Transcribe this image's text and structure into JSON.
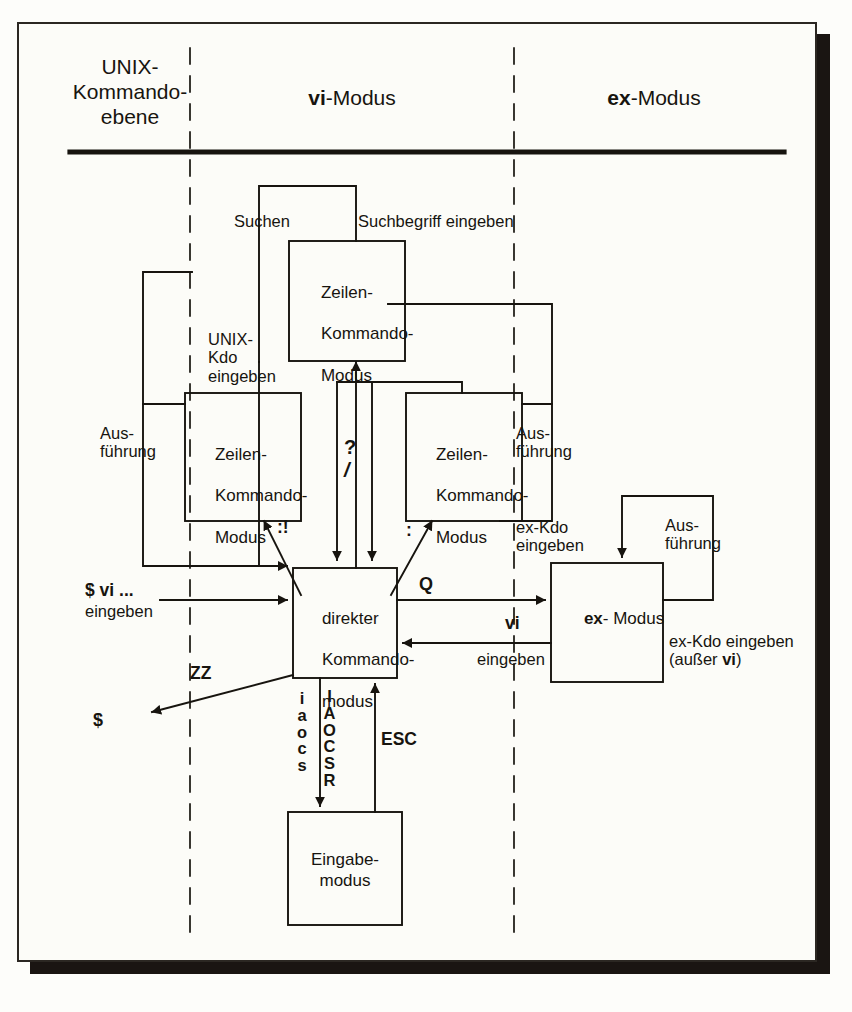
{
  "diagram": {
    "title_columns": [
      {
        "bold": "UNIX-",
        "rest": "Kommando-\nebene",
        "all_regular": true
      },
      {
        "bold": "vi",
        "rest": "-Modus"
      },
      {
        "bold": "ex",
        "rest": "-Modus"
      }
    ],
    "headers": {
      "unix_line1": "UNIX-",
      "unix_line2": "Kommando-",
      "unix_line3": "ebene",
      "vi_bold": "vi",
      "vi_rest": "-Modus",
      "ex_bold": "ex",
      "ex_rest": "-Modus"
    },
    "boxes": {
      "search_line_mode": {
        "line1": "Zeilen-",
        "line2": "Kommando-",
        "line3": "Modus"
      },
      "unix_line_mode": {
        "line1": "Zeilen-",
        "line2": "Kommando-",
        "line3": "Modus"
      },
      "ex_line_mode": {
        "line1": "Zeilen-",
        "line2": "Kommando-",
        "line3": "Modus"
      },
      "direct_command_mode": {
        "line1": "direkter",
        "line2": "Kommando-",
        "line3": "modus"
      },
      "ex_mode": {
        "bold": "ex",
        "rest": "- Modus"
      },
      "input_mode": {
        "line1": "Eingabe-",
        "line2": "modus"
      }
    },
    "labels": {
      "suchen": "Suchen",
      "suchbegriff_eingeben": "Suchbegriff eingeben",
      "unix_kdo_eingeben": "UNIX-\nKdo\neingeben",
      "ausfuehrung_left": "Aus-\nführung",
      "ausfuehrung_mid": "Aus-\nführung",
      "ausfuehrung_right": "Aus-\nführung",
      "ex_kdo_eingeben_mid": "ex-Kdo\neingeben",
      "ex_kdo_eingeben_right_l1": "ex-Kdo eingeben",
      "ex_kdo_eingeben_right_l2_pre": "(außer ",
      "ex_kdo_eingeben_right_l2_bold": "vi",
      "ex_kdo_eingeben_right_l2_post": ")",
      "question_mark": "?",
      "slash": "/",
      "colon_bang": ":!",
      "colon": ":",
      "q": "Q",
      "vi_key": "vi",
      "eingeben": "eingeben",
      "dollar_vi_bold": "$ vi ...",
      "dollar_vi_eingeben": "eingeben",
      "zz": "ZZ",
      "dollar": "$",
      "esc": "ESC",
      "insert_keys_lower": "i\na\no\nc\ns",
      "insert_keys_upper": "I\nA\nO\nC\nS\nR"
    }
  }
}
